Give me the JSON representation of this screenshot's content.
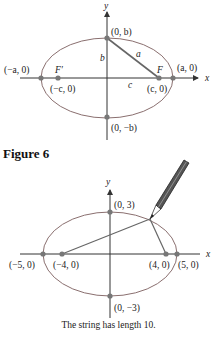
{
  "figure1": {
    "axis_x_label": "x",
    "axis_y_label": "y",
    "points": {
      "top": "(0, b)",
      "bottom": "(0, −b)",
      "left_vertex": "(−a, 0)",
      "right_vertex": "(a, 0)",
      "left_focus": "(−c, 0)",
      "right_focus": "(c, 0)"
    },
    "focus_labels": {
      "left": "F′",
      "right": "F"
    },
    "segment_labels": {
      "hyp": "a",
      "vert": "b",
      "horiz": "c"
    }
  },
  "caption_figure": "Figure 6",
  "figure2": {
    "axis_x_label": "x",
    "axis_y_label": "y",
    "points": {
      "top": "(0, 3)",
      "bottom": "(0, −3)",
      "left_vertex": "(−5, 0)",
      "right_vertex": "(5, 0)",
      "left_focus": "(−4, 0)",
      "right_focus": "(4, 0)"
    },
    "caption": "The string has length 10."
  },
  "colors": {
    "ellipse": "#8a6f6f",
    "axis": "#333333",
    "point": "#777777",
    "segment": "#666666"
  }
}
